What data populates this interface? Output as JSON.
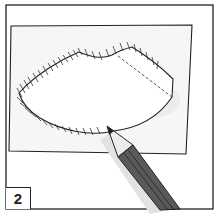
{
  "panel": {
    "step_number": "2",
    "description": "Hand-drawn illustration: a pencil tracing the outline of a shape with hatch marks on a sheet of paper"
  },
  "colors": {
    "ink": "#222222",
    "paper": "#f7f7f7",
    "pencil_body": "#5a5a5a",
    "pencil_wood": "#e8e8e8",
    "shadow": "#dcdcdc"
  }
}
